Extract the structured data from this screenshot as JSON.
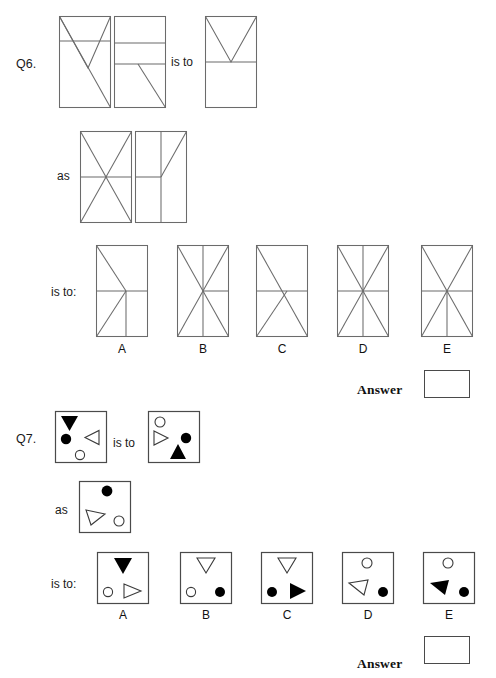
{
  "page": {
    "width": 496,
    "height": 678,
    "background": "#ffffff",
    "stroke_color": "#6b6b6b",
    "shape_stroke_color": "#3a3a3a",
    "solid_fill": "#000000",
    "hollow_fill": "#ffffff"
  },
  "questions": [
    {
      "id": "q6",
      "label": "Q6.",
      "connector_is_to": "is to",
      "connector_as": "as",
      "connector_is_to_colon": "is to:",
      "answer_label": "Answer",
      "answer_value": "",
      "option_labels": [
        "A",
        "B",
        "C",
        "D",
        "E"
      ],
      "type": "line-figures",
      "premise_pair_1": [
        {
          "name": "q6-premise-1a",
          "description": "tall rectangle with horizontal line at one quarter height, full diagonal top-left to bottom-right, and V from top-left to lower-middle to top-right"
        },
        {
          "name": "q6-premise-1b",
          "description": "tall rectangle split by two horizontal lines into three bands, diagonal in lowest band from mid-top to bottom-right"
        }
      ],
      "premise_result_1": {
        "name": "q6-result-1",
        "description": "tall rectangle with horizontal midline and V in upper half"
      },
      "premise_pair_2": [
        {
          "name": "q6-premise-2a",
          "description": "tall rectangle with horizontal midline and full X across both diagonals"
        },
        {
          "name": "q6-premise-2b",
          "description": "tall rectangle with full vertical centre line, horizontal midline on left half, diagonal in upper-right quadrant"
        }
      ],
      "options": [
        {
          "letter": "A",
          "name": "q6-option-a",
          "description": "diagonal from top-left to centre, horizontal midline, diagonal centre to bottom-left, vertical line in lower-right quadrant"
        },
        {
          "letter": "B",
          "name": "q6-option-b",
          "description": "full X, full vertical centre line, horizontal line on right half"
        },
        {
          "letter": "C",
          "name": "q6-option-c",
          "description": "diagonal top-left to bottom-right, horizontal midline, diagonal centre to bottom-left"
        },
        {
          "letter": "D",
          "name": "q6-option-d",
          "description": "full X, full vertical centre line, full horizontal midline"
        },
        {
          "letter": "E",
          "name": "q6-option-e",
          "description": "full X, full horizontal midline, vertical line in lower half only"
        }
      ]
    },
    {
      "id": "q7",
      "label": "Q7.",
      "connector_is_to": "is to",
      "connector_as": "as",
      "connector_is_to_colon": "is to:",
      "answer_label": "Answer",
      "answer_value": "",
      "option_labels": [
        "A",
        "B",
        "C",
        "D",
        "E"
      ],
      "type": "shape-figures",
      "premise_pair_1": [
        {
          "name": "q7-premise-1a",
          "shapes": "black down-triangle top-left, black circle mid-left, white left-triangle mid-right, white circle bottom-centre"
        },
        {
          "name": "q7-premise-1b",
          "shapes": "white circle top-left, white right-triangle mid-left, black circle mid-right, black up-triangle bottom-centre"
        }
      ],
      "premise_pair_2": [
        {
          "name": "q7-premise-2a",
          "shapes": "black circle top-centre, white left-triangle bottom-left, white circle bottom-right"
        }
      ],
      "options": [
        {
          "letter": "A",
          "name": "q7-option-a",
          "shapes": "black down-triangle top-centre, white circle bottom-left, white right-triangle bottom-right"
        },
        {
          "letter": "B",
          "name": "q7-option-b",
          "shapes": "white down-triangle top-centre, white circle bottom-left, black circle bottom-right"
        },
        {
          "letter": "C",
          "name": "q7-option-c",
          "shapes": "white down-triangle top-centre, black circle bottom-left, black right-triangle bottom-right"
        },
        {
          "letter": "D",
          "name": "q7-option-d",
          "shapes": "white circle top-centre, white left-triangle mid-left, black circle bottom-right"
        },
        {
          "letter": "E",
          "name": "q7-option-e",
          "shapes": "white circle top-centre, black left-triangle mid-left, black circle bottom-right"
        }
      ]
    }
  ]
}
